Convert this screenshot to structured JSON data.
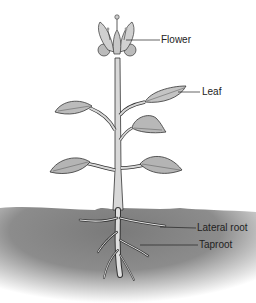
{
  "diagram": {
    "labels": {
      "flower": "Flower",
      "leaf": "Leaf",
      "lateral_root": "Lateral root",
      "taproot": "Taproot"
    },
    "colors": {
      "soil_dark": "#8a8a8a",
      "soil_light": "#ffffff",
      "plant_fill": "#d8d8d8",
      "leaf_fill": "#b8b8b8",
      "outline": "#333333"
    }
  }
}
